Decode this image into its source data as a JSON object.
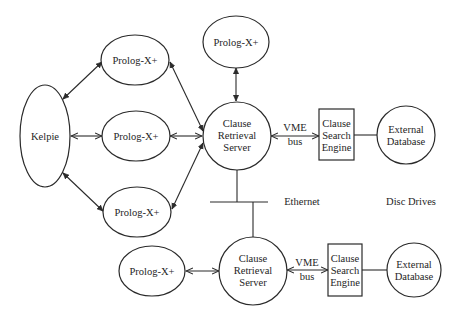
{
  "diagram": {
    "nodes": {
      "kelpie": "Kelpie",
      "prolog_top_left": "Prolog-X+",
      "prolog_mid_left": "Prolog-X+",
      "prolog_low_left": "Prolog-X+",
      "prolog_top": "Prolog-X+",
      "prolog_bottom": "Prolog-X+",
      "server_top": [
        "Clause",
        "Retrieval",
        "Server"
      ],
      "server_bottom": [
        "Clause",
        "Retrieval",
        "Server"
      ],
      "engine_top": [
        "Clause",
        "Search",
        "Engine"
      ],
      "engine_bottom": [
        "Clause",
        "Search",
        "Engine"
      ],
      "db_top": [
        "External",
        "Database"
      ],
      "db_bottom": [
        "External",
        "Database"
      ]
    },
    "edge_labels": {
      "vme_top": [
        "VME",
        "bus"
      ],
      "vme_bottom": [
        "VME",
        "bus"
      ],
      "ethernet": "Ethernet",
      "disc_drives": "Disc Drives"
    },
    "edges": [
      {
        "from": "kelpie",
        "to": "prolog_top_left",
        "type": "bidirectional"
      },
      {
        "from": "kelpie",
        "to": "prolog_mid_left",
        "type": "bidirectional"
      },
      {
        "from": "kelpie",
        "to": "prolog_low_left",
        "type": "bidirectional"
      },
      {
        "from": "prolog_top_left",
        "to": "server_top",
        "type": "bidirectional"
      },
      {
        "from": "prolog_mid_left",
        "to": "server_top",
        "type": "bidirectional"
      },
      {
        "from": "prolog_low_left",
        "to": "server_top",
        "type": "bidirectional"
      },
      {
        "from": "prolog_top",
        "to": "server_top",
        "type": "bidirectional"
      },
      {
        "from": "server_top",
        "to": "engine_top",
        "type": "bidirectional",
        "label": "VME bus"
      },
      {
        "from": "engine_top",
        "to": "db_top",
        "type": "line"
      },
      {
        "from": "server_top",
        "to": "ethernet",
        "type": "line"
      },
      {
        "from": "ethernet",
        "to": "server_bottom",
        "type": "line"
      },
      {
        "from": "prolog_bottom",
        "to": "server_bottom",
        "type": "bidirectional"
      },
      {
        "from": "server_bottom",
        "to": "engine_bottom",
        "type": "bidirectional",
        "label": "VME bus"
      },
      {
        "from": "engine_bottom",
        "to": "db_bottom",
        "type": "line"
      }
    ]
  }
}
